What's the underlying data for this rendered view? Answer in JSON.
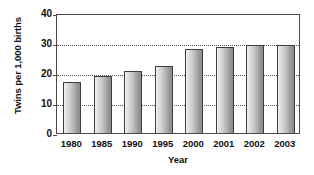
{
  "chart_data": {
    "type": "bar",
    "title": "",
    "subtitle": "",
    "xlabel": "Year",
    "ylabel": "Twins per 1,000 births",
    "categories": [
      "1980",
      "1985",
      "1990",
      "1995",
      "2000",
      "2001",
      "2002",
      "2003"
    ],
    "values": [
      17.3,
      19.3,
      21.0,
      22.6,
      28.4,
      29.0,
      29.6,
      29.6
    ],
    "series": [
      {
        "name": "Twins per 1,000 births",
        "values": [
          17.3,
          19.3,
          21.0,
          22.6,
          28.4,
          29.0,
          29.6,
          29.6
        ]
      }
    ],
    "ylim": [
      0,
      40
    ],
    "yticks": [
      0,
      10,
      20,
      30,
      40
    ],
    "ytick_labels": [
      "0",
      "10",
      "20",
      "30",
      "40"
    ],
    "gridlines_y": [
      10,
      20,
      30
    ],
    "grid": true,
    "legend": false,
    "legend_position": "none",
    "bar_fill_light": "#f2f2f2",
    "bar_fill_dark": "#8b8b8b",
    "bar_border_color": "#3d3d3d",
    "axis_color": "#4a4a4a",
    "gridline_color": "#555555",
    "text_color": "#111111",
    "background_color": "#ffffff"
  },
  "axes": {
    "y_title": "Twins per 1,000 births",
    "x_title": "Year"
  }
}
